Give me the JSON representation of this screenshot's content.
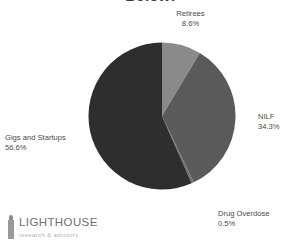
{
  "chart_data": {
    "type": "pie",
    "title": "Below:",
    "labels": [
      "Retirees",
      "NILF",
      "Drug Overdose",
      "Gigs and Startups"
    ],
    "values": [
      8.6,
      34.3,
      0.5,
      56.6
    ],
    "value_labels": [
      "8.6%",
      "34.3%",
      "0.5%",
      "56.6%"
    ],
    "colors": [
      "#8a8a8a",
      "#5a5a5a",
      "#6e6e6e",
      "#2e2e2e"
    ],
    "units": "percent",
    "legend": "none",
    "grid": false,
    "start_angle_deg": 0,
    "direction": "clockwise",
    "slices": [
      {
        "label": "Retirees",
        "value": 8.6,
        "value_label": "8.6%",
        "color": "#8a8a8a"
      },
      {
        "label": "NILF",
        "value": 34.3,
        "value_label": "34.3%",
        "color": "#5a5a5a"
      },
      {
        "label": "Drug Overdose",
        "value": 0.5,
        "value_label": "0.5%",
        "color": "#6e6e6e"
      },
      {
        "label": "Gigs and Startups",
        "value": 56.6,
        "value_label": "56.6%",
        "color": "#2e2e2e"
      }
    ]
  },
  "logo": {
    "name": "LIGHTHOUSE",
    "tagline": "research & advisory"
  }
}
